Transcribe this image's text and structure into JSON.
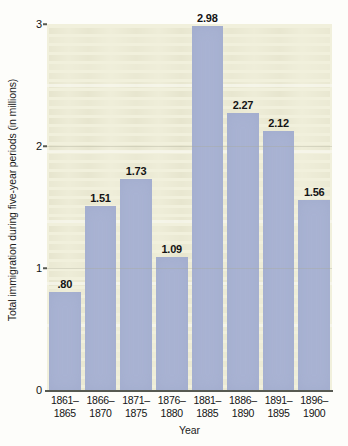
{
  "chart_data": {
    "type": "bar",
    "title": "",
    "xlabel": "Year",
    "ylabel": "Total immigration during five-year periods (in millions)",
    "categories": [
      "1861–1865",
      "1866–1870",
      "1871–1875",
      "1876–1880",
      "1881–1885",
      "1886–1890",
      "1891–1895",
      "1896–1900"
    ],
    "category_lines": [
      [
        "1861–",
        "1865"
      ],
      [
        "1866–",
        "1870"
      ],
      [
        "1871–",
        "1875"
      ],
      [
        "1876–",
        "1880"
      ],
      [
        "1881–",
        "1885"
      ],
      [
        "1886–",
        "1890"
      ],
      [
        "1891–",
        "1895"
      ],
      [
        "1896–",
        "1900"
      ]
    ],
    "values": [
      0.8,
      1.51,
      1.73,
      1.09,
      2.98,
      2.27,
      2.12,
      1.56
    ],
    "value_labels": [
      ".80",
      "1.51",
      "1.73",
      "1.09",
      "2.98",
      "2.27",
      "2.12",
      "1.56"
    ],
    "ylim": [
      0,
      3
    ],
    "yticks": [
      0,
      1,
      2,
      3
    ],
    "ytick_labels": [
      "0",
      "1",
      "2",
      "3"
    ],
    "grid": false,
    "legend": null,
    "colors": {
      "bar_fill": "#a9b3d3",
      "plot_background": "#f1f0dc",
      "axis_line": "#575a52",
      "text": "#141414",
      "page_background": "#fdfdfa"
    }
  }
}
